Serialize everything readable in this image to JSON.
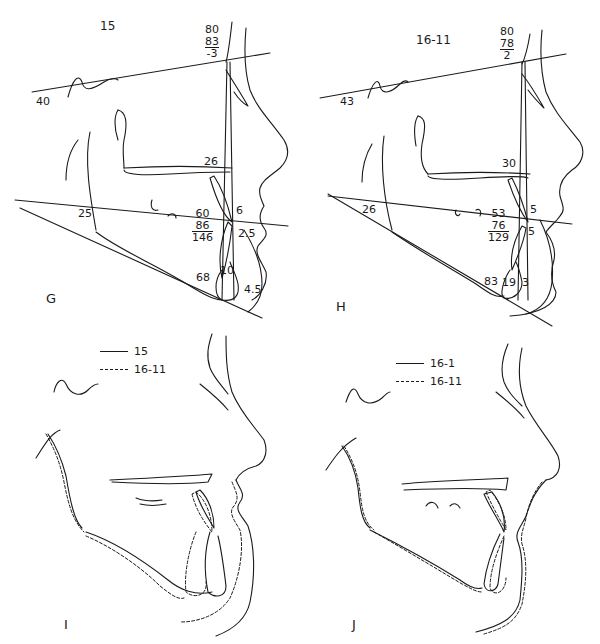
{
  "panels": {
    "g": {
      "letter": "G",
      "age": "15",
      "sn_angle_frac": {
        "top": "80",
        "middle": "83",
        "bottom": "-3"
      },
      "sn_mp_angle": "40",
      "palatal_label": "26",
      "occlusal_angle": "25",
      "interincisal_frac": {
        "top": "60",
        "middle": "86",
        "bottom": "146"
      },
      "upper_incisor_label": "6",
      "lip_label": "2.5",
      "lower_incisor_mp": "68",
      "chin_label": "10",
      "soft_chin_label": "4.5"
    },
    "h": {
      "letter": "H",
      "age": "16-11",
      "sn_angle_frac": {
        "top": "80",
        "middle": "78",
        "bottom": "2"
      },
      "sn_mp_angle": "43",
      "palatal_label": "30",
      "occlusal_angle": "26",
      "interincisal_frac": {
        "top": "53",
        "middle": "76",
        "bottom": "129"
      },
      "upper_incisor_label": "5",
      "lip_label": "5",
      "lower_incisor_mp": "83",
      "chin_label": "19",
      "soft_chin_label": "3"
    },
    "i": {
      "letter": "I",
      "legend": [
        {
          "style": "solid",
          "label": "15"
        },
        {
          "style": "dashed",
          "label": "16-11"
        }
      ]
    },
    "j": {
      "letter": "J",
      "legend": [
        {
          "style": "solid",
          "label": "16-1"
        },
        {
          "style": "dashed",
          "label": "16-11"
        }
      ]
    }
  }
}
